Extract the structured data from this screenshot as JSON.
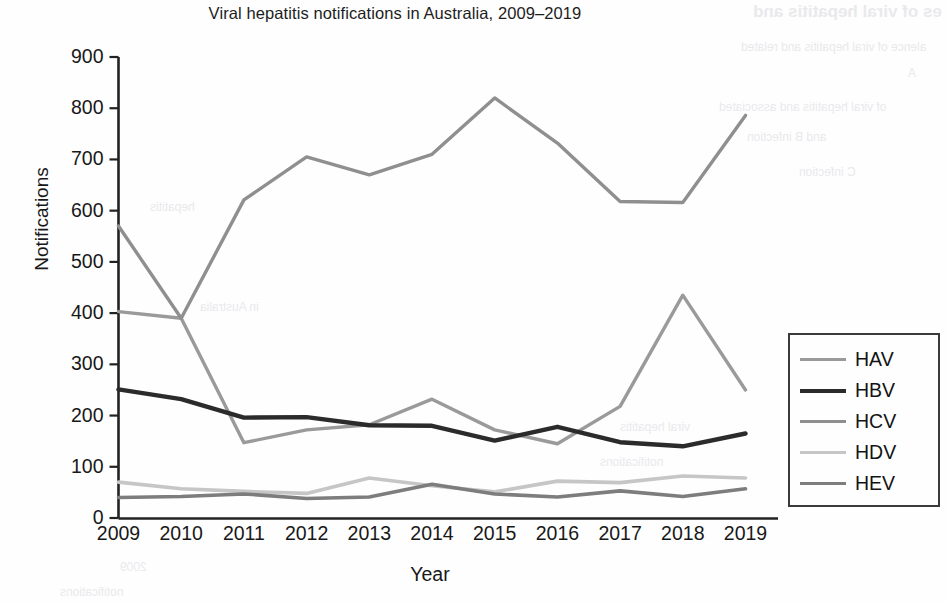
{
  "chart_title": "Viral hepatitis notifications in Australia, 2009–2019",
  "axes": {
    "ylabel": "Notifications",
    "xlabel": "Year",
    "yticks": [
      "0",
      "100",
      "200",
      "300",
      "400",
      "500",
      "600",
      "700",
      "800",
      "900"
    ],
    "xticks": [
      "2009",
      "2010",
      "2011",
      "2012",
      "2013",
      "2014",
      "2015",
      "2016",
      "2017",
      "2018",
      "2019"
    ]
  },
  "legend": {
    "items": [
      {
        "label": "HAV",
        "color": "#9a9a9a"
      },
      {
        "label": "HBV",
        "color": "#2b2b2b"
      },
      {
        "label": "HCV",
        "color": "#8f8f8f"
      },
      {
        "label": "HDV",
        "color": "#c6c6c6"
      },
      {
        "label": "HEV",
        "color": "#7d7d7d"
      }
    ]
  },
  "bleed_through": {
    "title": "es of viral hepatitis and",
    "line1": "alence of viral hepatitis and related",
    "line2": "A",
    "line3": "of viral hepatitis and associated",
    "line4": "and B infection",
    "line5": "C infection",
    "line6": "2009",
    "line7": "notifications",
    "line8": "hepatitis",
    "line9": "in Australia",
    "line10": "viral hepatitis",
    "line11": "notifications"
  },
  "chart_data": {
    "type": "line",
    "title": "Viral hepatitis notifications in Australia, 2009–2019",
    "xlabel": "Year",
    "ylabel": "Notifications",
    "xlim": [
      2009,
      2019
    ],
    "ylim": [
      0,
      900
    ],
    "ytick_step": 100,
    "grid": false,
    "legend_position": "right",
    "x": [
      2009,
      2010,
      2011,
      2012,
      2013,
      2014,
      2015,
      2016,
      2017,
      2018,
      2019
    ],
    "categories": [
      "2009",
      "2010",
      "2011",
      "2012",
      "2013",
      "2014",
      "2015",
      "2016",
      "2017",
      "2018",
      "2019"
    ],
    "series": [
      {
        "name": "HAV",
        "color": "#9a9a9a",
        "values": [
          403,
          390,
          147,
          172,
          182,
          232,
          172,
          145,
          218,
          435,
          250
        ]
      },
      {
        "name": "HBV",
        "color": "#2b2b2b",
        "values": [
          251,
          232,
          196,
          197,
          181,
          180,
          151,
          178,
          148,
          140,
          165
        ]
      },
      {
        "name": "HCV",
        "color": "#8f8f8f",
        "values": [
          570,
          390,
          621,
          705,
          670,
          710,
          820,
          732,
          618,
          616,
          786
        ]
      },
      {
        "name": "HDV",
        "color": "#c6c6c6",
        "values": [
          70,
          57,
          52,
          48,
          78,
          63,
          51,
          72,
          69,
          82,
          78
        ]
      },
      {
        "name": "HEV",
        "color": "#7d7d7d",
        "values": [
          40,
          42,
          47,
          38,
          41,
          66,
          47,
          41,
          53,
          42,
          57
        ]
      }
    ]
  }
}
